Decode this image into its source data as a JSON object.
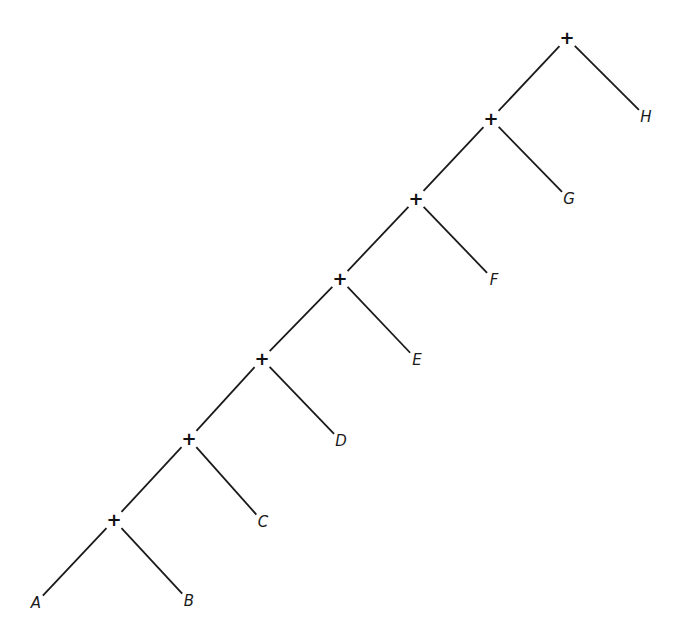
{
  "diagram": {
    "type": "binary-tree",
    "operator_symbol": "+",
    "operators": [
      {
        "id": "n1",
        "x": 567,
        "y": 38
      },
      {
        "id": "n2",
        "x": 491,
        "y": 119
      },
      {
        "id": "n3",
        "x": 416,
        "y": 199
      },
      {
        "id": "n4",
        "x": 340,
        "y": 279
      },
      {
        "id": "n5",
        "x": 262,
        "y": 359
      },
      {
        "id": "n6",
        "x": 189,
        "y": 439
      },
      {
        "id": "n7",
        "x": 114,
        "y": 520
      }
    ],
    "leaves": [
      {
        "label": "A",
        "x": 36,
        "y": 603
      },
      {
        "label": "B",
        "x": 189,
        "y": 601
      },
      {
        "label": "C",
        "x": 263,
        "y": 522
      },
      {
        "label": "D",
        "x": 341,
        "y": 441
      },
      {
        "label": "E",
        "x": 417,
        "y": 360
      },
      {
        "label": "F",
        "x": 494,
        "y": 280
      },
      {
        "label": "G",
        "x": 569,
        "y": 199
      },
      {
        "label": "H",
        "x": 646,
        "y": 117
      }
    ],
    "edges": [
      [
        "n1",
        "n2"
      ],
      [
        "n1",
        "H"
      ],
      [
        "n2",
        "n3"
      ],
      [
        "n2",
        "G"
      ],
      [
        "n3",
        "n4"
      ],
      [
        "n3",
        "F"
      ],
      [
        "n4",
        "n5"
      ],
      [
        "n4",
        "E"
      ],
      [
        "n5",
        "n6"
      ],
      [
        "n5",
        "D"
      ],
      [
        "n6",
        "n7"
      ],
      [
        "n6",
        "C"
      ],
      [
        "n7",
        "A"
      ],
      [
        "n7",
        "B"
      ]
    ],
    "line_color": "#1a1a1a"
  }
}
